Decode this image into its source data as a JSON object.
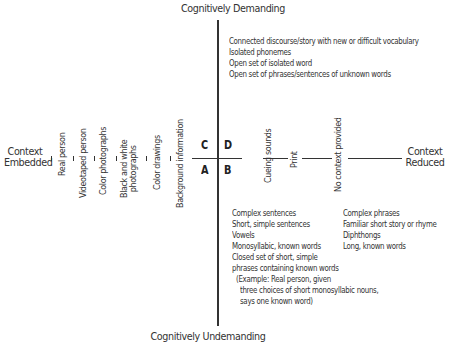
{
  "diagram": {
    "top_label": "Cognitively Demanding",
    "bottom_label": "Cognitively Undemanding",
    "left_label_line1": "Context",
    "left_label_line2": "Embedded",
    "right_label_line1": "Context",
    "right_label_line2": "Reduced",
    "quadrants": {
      "C": "C",
      "D": "D",
      "A": "A",
      "B": "B"
    },
    "left_axis_items": [
      {
        "line1": "Real person",
        "line2": ""
      },
      {
        "line1": "Videotaped person",
        "line2": ""
      },
      {
        "line1": "Color photographs",
        "line2": ""
      },
      {
        "line1": "Black and white",
        "line2": "photographs"
      },
      {
        "line1": "Color drawings",
        "line2": ""
      },
      {
        "line1": "Background information",
        "line2": ""
      }
    ],
    "right_axis_items": [
      "Cueing sounds",
      "Print",
      "No context provided"
    ],
    "quadrant_D_items": [
      "Connected discourse/story with new or difficult vocabulary",
      "Isolated phonemes",
      "Open set of isolated word",
      "Open set of phrases/sentences of unknown words"
    ],
    "quadrant_B_left_items": [
      "Complex sentences",
      "Short, simple sentences",
      "Vowels",
      "Monosyllabic, known words",
      "Closed set of short, simple",
      "phrases containing known words",
      "(Example:  Real person, given",
      "three choices of short monosyllabic nouns,",
      "says one known word)"
    ],
    "quadrant_B_right_items": [
      "Complex phrases",
      "Familiar short story or rhyme",
      "Diphthongs",
      "Long, known words"
    ]
  }
}
